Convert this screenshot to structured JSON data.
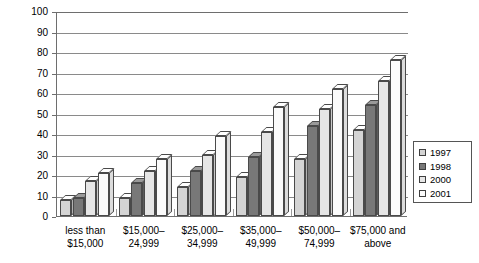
{
  "chart_data": {
    "type": "bar",
    "title": "",
    "xlabel": "",
    "ylabel": "Percent of U.S. Households",
    "ylim": [
      0,
      100
    ],
    "ytick_step": 10,
    "yticks": [
      "0",
      "10",
      "20",
      "30",
      "40",
      "50",
      "60",
      "70",
      "80",
      "90",
      "100"
    ],
    "grid": true,
    "legend_position": "right",
    "categories": [
      "less than $15,000",
      "$15,000–24,999",
      "$25,000–34,999",
      "$35,000–49,999",
      "$50,000–74,999",
      "$75,000 and above"
    ],
    "category_lines": [
      [
        "less than",
        "$15,000"
      ],
      [
        "$15,000–",
        "24,999"
      ],
      [
        "$25,000–",
        "34,999"
      ],
      [
        "$35,000–",
        "49,999"
      ],
      [
        "$50,000–",
        "74,999"
      ],
      [
        "$75,000 and",
        "above"
      ]
    ],
    "series": [
      {
        "name": "1997",
        "color": "#d4d4d4",
        "values": [
          8,
          9,
          14,
          19,
          28,
          42
        ]
      },
      {
        "name": "1998",
        "color": "#787878",
        "values": [
          9,
          16,
          22,
          29,
          44,
          54
        ]
      },
      {
        "name": "2000",
        "color": "#e6e6e6",
        "values": [
          17,
          22,
          30,
          41,
          52,
          66
        ]
      },
      {
        "name": "2001",
        "color": "#fbfbfb",
        "values": [
          21,
          28,
          39,
          53,
          62,
          76
        ]
      }
    ]
  },
  "legend": {
    "items": [
      {
        "label": "1997",
        "color": "#d4d4d4"
      },
      {
        "label": "1998",
        "color": "#787878"
      },
      {
        "label": "2000",
        "color": "#e6e6e6"
      },
      {
        "label": "2001",
        "color": "#fbfbfb"
      }
    ]
  },
  "caption": ""
}
